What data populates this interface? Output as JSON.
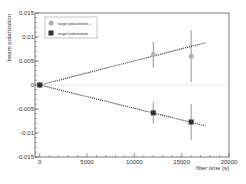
{
  "chart_data": {
    "type": "scatter",
    "title": "",
    "xlabel": "filter time (s)",
    "ylabel": "beam polarization",
    "xlim": [
      -500,
      20000
    ],
    "ylim": [
      -0.015,
      0.015
    ],
    "xticks": [
      0,
      5000,
      10000,
      15000,
      20000
    ],
    "xtick_labels": [
      "0",
      "5000",
      "10000",
      "15000",
      "20000"
    ],
    "yticks": [
      -0.015,
      -0.01,
      -0.005,
      0,
      0.005,
      0.01,
      0.015
    ],
    "ytick_labels": [
      "-0.015",
      "-0.01",
      "-0.005",
      "0",
      "0.005",
      "0.01",
      "0.015"
    ],
    "grid": false,
    "legend_position": "upper left",
    "series": [
      {
        "name": "target polarization +",
        "marker": "circle",
        "color": "#b0b0b0",
        "x": [
          0,
          12000,
          16000
        ],
        "y": [
          0.0,
          0.0063,
          0.006
        ],
        "yerr": [
          0.0005,
          0.0027,
          0.0054
        ],
        "fit": {
          "x": [
            0,
            17500
          ],
          "y": [
            0.0,
            0.0088
          ]
        }
      },
      {
        "name": "target polarization -",
        "marker": "square",
        "color": "#333333",
        "x": [
          0,
          12000,
          16000
        ],
        "y": [
          0.0,
          -0.0058,
          -0.0077
        ],
        "yerr": [
          0.0005,
          0.0022,
          0.0037
        ],
        "fit": {
          "x": [
            0,
            17500
          ],
          "y": [
            0.0,
            -0.0085
          ]
        }
      }
    ],
    "reference_line": {
      "y": 0,
      "style": "dotted"
    }
  },
  "legend": {
    "entries": [
      "target polarization +",
      "target polarization -"
    ]
  }
}
